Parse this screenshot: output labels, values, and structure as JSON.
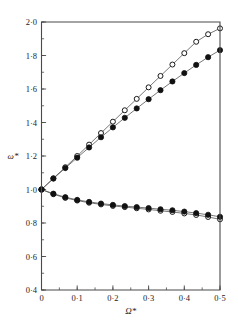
{
  "chart_data": {
    "type": "line",
    "title": "",
    "subtitle": "",
    "xlabel": "Ω*",
    "ylabel": "ω*",
    "xlim": [
      0,
      0.5
    ],
    "ylim": [
      0.4,
      2.0
    ],
    "grid": false,
    "legend": "none",
    "x_ticks": [
      0,
      0.1,
      0.2,
      0.3,
      0.4,
      0.5
    ],
    "x_tick_labels": [
      "0",
      "0·1",
      "0·2",
      "0·3",
      "0·4",
      "0·5"
    ],
    "x_minor_step": 0.05,
    "y_ticks": [
      0.4,
      0.6,
      0.8,
      1.0,
      1.2,
      1.4,
      1.6,
      1.8,
      2.0
    ],
    "y_tick_labels": [
      "0·4",
      "0·6",
      "0·8",
      "1·0",
      "1·2",
      "1·4",
      "1·6",
      "1·8",
      "2·0"
    ],
    "y_minor_step": 0.1,
    "marker_colors": {
      "open": "#ffffff",
      "filled": "#111111",
      "edge": "#1a1a1a",
      "line": "#555555",
      "axis": "#4a4a4a"
    },
    "x": [
      0.0,
      0.0333,
      0.0667,
      0.1,
      0.1333,
      0.1667,
      0.2,
      0.2333,
      0.2667,
      0.3,
      0.3333,
      0.3667,
      0.4,
      0.4333,
      0.4667,
      0.5
    ],
    "series": [
      {
        "name": "upper-branch-open",
        "marker": "open-circle",
        "values": [
          1.0,
          1.067,
          1.133,
          1.2,
          1.268,
          1.337,
          1.405,
          1.473,
          1.541,
          1.61,
          1.678,
          1.746,
          1.814,
          1.882,
          1.927,
          1.962
        ]
      },
      {
        "name": "upper-branch-filled",
        "marker": "filled-circle",
        "values": [
          1.0,
          1.065,
          1.128,
          1.19,
          1.251,
          1.312,
          1.371,
          1.428,
          1.484,
          1.539,
          1.593,
          1.645,
          1.695,
          1.744,
          1.79,
          1.832
        ]
      },
      {
        "name": "lower-branch-open",
        "marker": "open-circle",
        "values": [
          1.0,
          0.972,
          0.95,
          0.934,
          0.921,
          0.911,
          0.902,
          0.895,
          0.888,
          0.881,
          0.873,
          0.866,
          0.857,
          0.848,
          0.836,
          0.822
        ]
      },
      {
        "name": "lower-branch-filled",
        "marker": "filled-circle",
        "values": [
          1.0,
          0.975,
          0.954,
          0.938,
          0.926,
          0.916,
          0.908,
          0.901,
          0.895,
          0.889,
          0.882,
          0.876,
          0.868,
          0.859,
          0.849,
          0.837
        ]
      }
    ]
  }
}
